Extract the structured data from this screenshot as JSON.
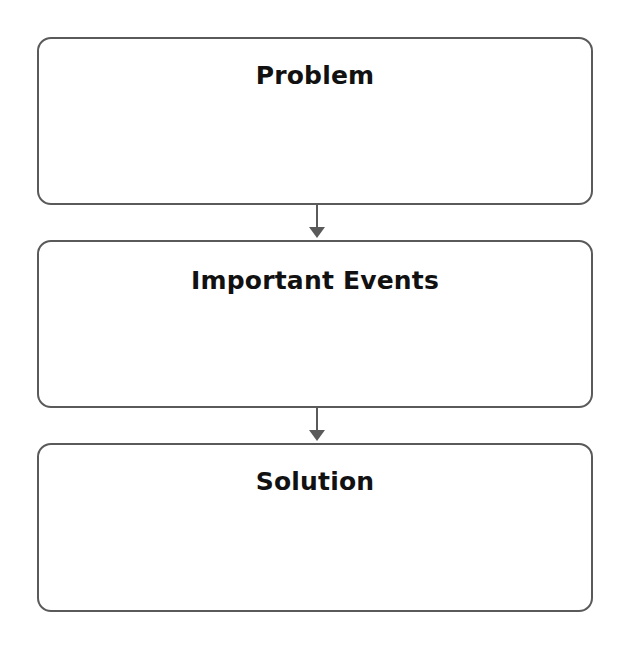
{
  "diagram": {
    "type": "flowchart",
    "direction": "top-to-bottom",
    "boxes": [
      {
        "title": "Problem",
        "content": ""
      },
      {
        "title": "Important Events",
        "content": ""
      },
      {
        "title": "Solution",
        "content": ""
      }
    ],
    "arrows": [
      {
        "from": "Problem",
        "to": "Important Events"
      },
      {
        "from": "Important Events",
        "to": "Solution"
      }
    ],
    "colors": {
      "border": "#5a5a5a",
      "title_text": "#111111",
      "background": "#ffffff"
    }
  }
}
